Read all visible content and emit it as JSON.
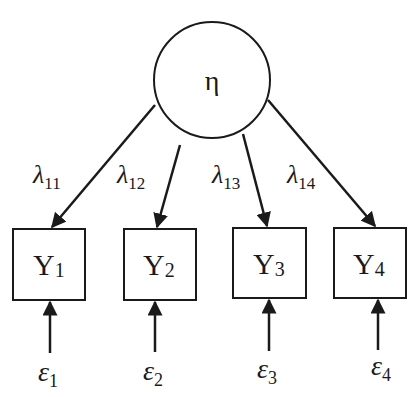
{
  "diagram": {
    "type": "measurement-model",
    "latent": {
      "id": "eta",
      "label": "η",
      "cx": 212,
      "cy": 80,
      "r": 58
    },
    "indicators": [
      {
        "id": "Y1",
        "label": "Y",
        "sub": "1",
        "x": 13,
        "y": 229,
        "w": 72,
        "h": 71
      },
      {
        "id": "Y2",
        "label": "Y",
        "sub": "2",
        "x": 124,
        "y": 229,
        "w": 72,
        "h": 71
      },
      {
        "id": "Y3",
        "label": "Y",
        "sub": "3",
        "x": 233,
        "y": 228,
        "w": 73,
        "h": 70
      },
      {
        "id": "Y4",
        "label": "Y",
        "sub": "4",
        "x": 334,
        "y": 228,
        "w": 72,
        "h": 70
      }
    ],
    "loadings": [
      {
        "label": "λ",
        "sub": "11",
        "from": [
          155,
          105
        ],
        "to": [
          51,
          229
        ]
      },
      {
        "label": "λ",
        "sub": "12",
        "from": [
          180,
          145
        ],
        "to": [
          156,
          229
        ]
      },
      {
        "label": "λ",
        "sub": "13",
        "from": [
          243,
          134
        ],
        "to": [
          268,
          228
        ]
      },
      {
        "label": "λ",
        "sub": "14",
        "from": [
          268,
          100
        ],
        "to": [
          376,
          228
        ]
      }
    ],
    "errors": [
      {
        "label": "ε",
        "sub": "1",
        "x": 50
      },
      {
        "label": "ε",
        "sub": "2",
        "x": 155
      },
      {
        "label": "ε",
        "sub": "3",
        "x": 269
      },
      {
        "label": "ε",
        "sub": "4",
        "x": 378
      }
    ]
  }
}
